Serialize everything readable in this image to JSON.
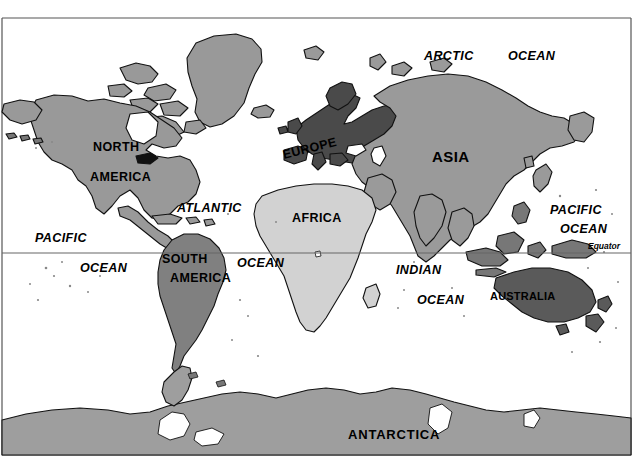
{
  "map": {
    "title": "World Map",
    "projection": "rectangular",
    "background_color": "#ffffff",
    "border_color": "#555555",
    "equator": {
      "label": "Equator",
      "line_color": "#666666",
      "y_fraction": 0.5
    },
    "legend_shades": {
      "north_america": "#999999",
      "south_america": "#808080",
      "europe": "#4a4a4a",
      "africa": "#d2d2d2",
      "asia": "#9a9a9a",
      "australia": "#5a5a5a",
      "antarctica": "#9e9e9e",
      "outline": "#111111"
    },
    "continent_labels": [
      {
        "name": "north-america",
        "lines": [
          "NORTH",
          "AMERICA"
        ]
      },
      {
        "name": "south-america",
        "lines": [
          "SOUTH",
          "AMERICA"
        ]
      },
      {
        "name": "europe",
        "lines": [
          "EUROPE"
        ]
      },
      {
        "name": "africa",
        "lines": [
          "AFRICA"
        ]
      },
      {
        "name": "asia",
        "lines": [
          "ASIA"
        ]
      },
      {
        "name": "australia",
        "lines": [
          "AUSTRALIA"
        ]
      },
      {
        "name": "antarctica",
        "lines": [
          "ANTARCTICA"
        ]
      }
    ],
    "ocean_labels": [
      {
        "name": "arctic-ocean",
        "line1": "ARCTIC",
        "line2": "OCEAN"
      },
      {
        "name": "pacific-ocean-west",
        "line1": "PACIFIC",
        "line2": "OCEAN"
      },
      {
        "name": "pacific-ocean-east",
        "line1": "PACIFIC",
        "line2": "OCEAN"
      },
      {
        "name": "atlantic-ocean",
        "line1": "ATLANTIC",
        "line2": "OCEAN"
      },
      {
        "name": "indian-ocean",
        "line1": "INDIAN",
        "line2": "OCEAN"
      }
    ]
  },
  "labels": {
    "arctic": "ARCTIC",
    "arctic_ocean": "OCEAN",
    "asia": "ASIA",
    "north": "NORTH",
    "america_n": "AMERICA",
    "atlantic": "ATLANTIC",
    "atlantic_ocean": "OCEAN",
    "pacific_west": "PACIFIC",
    "pacific_west_ocean": "OCEAN",
    "pacific_east": "PACIFIC",
    "pacific_east_ocean": "OCEAN",
    "europe": "EUROPE",
    "africa": "AFRICA",
    "south": "SOUTH",
    "america_s": "AMERICA",
    "indian": "INDIAN",
    "indian_ocean": "OCEAN",
    "australia": "AUSTRALIA",
    "antarctica": "ANTARCTICA",
    "equator": "Equator"
  }
}
